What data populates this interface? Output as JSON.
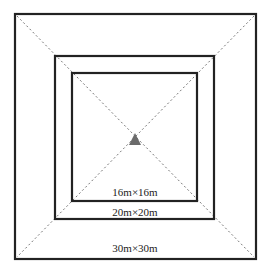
{
  "diagram": {
    "squares": [
      {
        "label": "30m×30m",
        "x": 15,
        "y": 14,
        "w": 241,
        "h": 245
      },
      {
        "label": "20m×20m",
        "x": 55,
        "y": 56,
        "w": 159,
        "h": 163
      },
      {
        "label": "16m×16m",
        "x": 72,
        "y": 73,
        "w": 125,
        "h": 128
      }
    ],
    "center_marker": {
      "shape": "triangle",
      "color": "#666666"
    },
    "labels": {
      "inner": "16m×16m",
      "middle": "20m×20m",
      "outer": "30m×30m"
    },
    "colors": {
      "line": "#222222",
      "diagonal": "#777777",
      "marker": "#6b6b6b"
    }
  }
}
